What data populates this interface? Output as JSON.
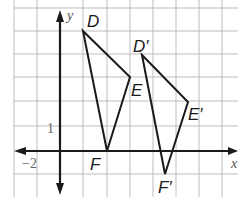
{
  "diagram": {
    "type": "coordinate-grid-translation",
    "axes": {
      "x_label": "x",
      "y_label": "y",
      "tick_labels": {
        "x": "−2",
        "y": "1"
      }
    },
    "triangles": [
      {
        "name": "DEF",
        "vertices": [
          {
            "label": "D",
            "x": 1,
            "y": 5
          },
          {
            "label": "E",
            "x": 3,
            "y": 3
          },
          {
            "label": "F",
            "x": 2,
            "y": 0
          }
        ]
      },
      {
        "name": "D'E'F'",
        "vertices": [
          {
            "label": "D′",
            "x": 3.5,
            "y": 4
          },
          {
            "label": "E′",
            "x": 5.5,
            "y": 2
          },
          {
            "label": "F′",
            "x": 4.5,
            "y": -1
          }
        ]
      }
    ]
  }
}
